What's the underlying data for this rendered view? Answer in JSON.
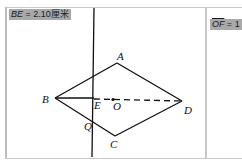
{
  "left_panel": {
    "measurement": {
      "name": "BE",
      "value": "2.10",
      "unit": "厘米"
    },
    "points": {
      "A": "A",
      "B": "B",
      "C": "C",
      "D": "D",
      "E": "E",
      "O": "O",
      "Q": "Q"
    }
  },
  "right_panel": {
    "measurement": {
      "name": "OF",
      "value": "1"
    }
  },
  "colors": {
    "label_bg": "#a9a9a9",
    "line": "#111111",
    "frame": "#c8c8c8"
  }
}
